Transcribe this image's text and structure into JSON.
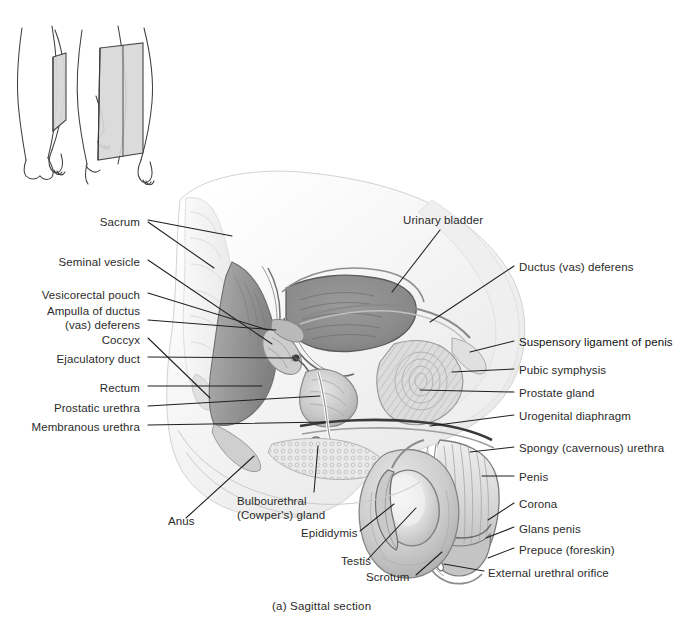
{
  "figure": {
    "caption": "(a)  Sagittal section",
    "background_color": "#ffffff",
    "text_color": "#2b2b2b",
    "width": 678,
    "height": 630
  },
  "orientation_inset": {
    "name": "sagittal-plane-orientation-inset",
    "description": "Two male body outlines with a shaded rectangular plane indicating the sagittal section",
    "plane_fill": "#d8d8d8",
    "outline_color": "#3a3a3a"
  },
  "labels_left": [
    {
      "text": "Sacrum",
      "x": 140,
      "y": 223
    },
    {
      "text": "Seminal vesicle",
      "x": 140,
      "y": 263
    },
    {
      "text": "Vesicorectal pouch",
      "x": 140,
      "y": 296
    },
    {
      "text": "Ampulla of ductus\n(vas) deferens",
      "x": 140,
      "y": 318
    },
    {
      "text": "Coccyx",
      "x": 140,
      "y": 341
    },
    {
      "text": "Ejaculatory duct",
      "x": 140,
      "y": 360
    },
    {
      "text": "Rectum",
      "x": 140,
      "y": 389
    },
    {
      "text": "Prostatic urethra",
      "x": 140,
      "y": 409
    },
    {
      "text": "Membranous urethra",
      "x": 140,
      "y": 428
    }
  ],
  "labels_right": [
    {
      "text": "Ductus (vas) deferens",
      "x": 519,
      "y": 268
    },
    {
      "text": "Suspensory ligament of penis",
      "x": 519,
      "y": 343
    },
    {
      "text": "Pubic symphysis",
      "x": 519,
      "y": 371
    },
    {
      "text": "Prostate gland",
      "x": 519,
      "y": 394
    },
    {
      "text": "Urogenital diaphragm",
      "x": 519,
      "y": 417
    },
    {
      "text": "Spongy (cavernous) urethra",
      "x": 519,
      "y": 449
    },
    {
      "text": "Penis",
      "x": 519,
      "y": 478
    },
    {
      "text": "Corona",
      "x": 519,
      "y": 505
    },
    {
      "text": "Glans penis",
      "x": 519,
      "y": 530
    },
    {
      "text": "Prepuce (foreskin)",
      "x": 519,
      "y": 551
    },
    {
      "text": "External urethral orifice",
      "x": 488,
      "y": 574
    }
  ],
  "labels_top": [
    {
      "text": "Urinary bladder",
      "x": 403,
      "y": 221
    }
  ],
  "labels_bottom": [
    {
      "text": "Anus",
      "x": 168,
      "y": 522
    },
    {
      "text": "Bulbourethral\n(Cowper's) gland",
      "x": 237,
      "y": 502
    },
    {
      "text": "Epididymis",
      "x": 301,
      "y": 534
    },
    {
      "text": "Testis",
      "x": 341,
      "y": 562
    },
    {
      "text": "Scrotum",
      "x": 366,
      "y": 578
    }
  ],
  "anatomy_regions": [
    {
      "name": "urinary-bladder",
      "shade": "#8c8c8c"
    },
    {
      "name": "prostate-gland",
      "shade": "#b9b9b9"
    },
    {
      "name": "rectum",
      "shade": "#9a9a9a"
    },
    {
      "name": "sacrum",
      "shade": "#ededed"
    },
    {
      "name": "pubic-symphysis",
      "shade": "#cfcfcf"
    },
    {
      "name": "testis",
      "shade": "#e2e2e2"
    },
    {
      "name": "scrotum",
      "shade": "#c8c8c8"
    },
    {
      "name": "penis-shaft",
      "shade": "#d5d5d5"
    },
    {
      "name": "glans-penis",
      "shade": "#bdbdbd"
    },
    {
      "name": "seminal-vesicle",
      "shade": "#a5a5a5"
    }
  ]
}
